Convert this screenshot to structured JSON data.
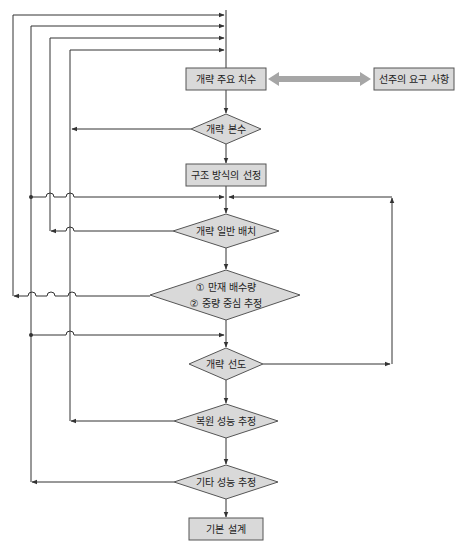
{
  "diagram": {
    "title": "",
    "colors": {
      "node_fill": "#d9d9d9",
      "node_stroke": "#555555",
      "line": "#333333",
      "double_arrow": "#a6a6a6"
    },
    "nodes": [
      {
        "id": "main-dimensions",
        "type": "box",
        "label": "개략 주요 치수",
        "cx": 226,
        "cy": 79,
        "w": 80,
        "h": 22
      },
      {
        "id": "owner-requirements",
        "type": "box",
        "label": "선주의 요구 사항",
        "cx": 419,
        "cy": 79,
        "w": 76,
        "h": 22
      },
      {
        "id": "hull-form-coefficient",
        "type": "diamond",
        "label": "개략 본수",
        "cx": 226,
        "cy": 129,
        "w": 70,
        "h": 30
      },
      {
        "id": "structure-selection",
        "type": "box",
        "label": "구조 방식의 선정",
        "cx": 226,
        "cy": 175,
        "w": 80,
        "h": 22
      },
      {
        "id": "general-arrangement",
        "type": "diamond",
        "label": "개략 일반 배치",
        "cx": 226,
        "cy": 231,
        "w": 106,
        "h": 34
      },
      {
        "id": "displacement-cog",
        "type": "diamond",
        "label_lines": [
          "① 만재 배수량",
          "② 중량 중심 추정"
        ],
        "cx": 226,
        "cy": 295,
        "w": 152,
        "h": 50
      },
      {
        "id": "lines-plan",
        "type": "diamond",
        "label": "개략 선도",
        "cx": 226,
        "cy": 364,
        "w": 74,
        "h": 32
      },
      {
        "id": "stability-estimate",
        "type": "diamond",
        "label": "복원 성능 추정",
        "cx": 226,
        "cy": 421,
        "w": 104,
        "h": 34
      },
      {
        "id": "other-performance",
        "type": "diamond",
        "label": "기타 성능 추정",
        "cx": 226,
        "cy": 482,
        "w": 104,
        "h": 34
      },
      {
        "id": "basic-design",
        "type": "box",
        "label": "기본 설계",
        "cx": 226,
        "cy": 529,
        "w": 74,
        "h": 22
      }
    ],
    "feedback_loops": [
      {
        "from": "displacement-cog",
        "x": 13,
        "top_y": 15
      },
      {
        "from": "other-performance",
        "x": 31,
        "top_y": 26
      },
      {
        "from": "general-arrangement",
        "x": 50,
        "top_y": 38
      },
      {
        "from": "stability-estimate",
        "x": 70,
        "top_y": 50
      }
    ]
  }
}
